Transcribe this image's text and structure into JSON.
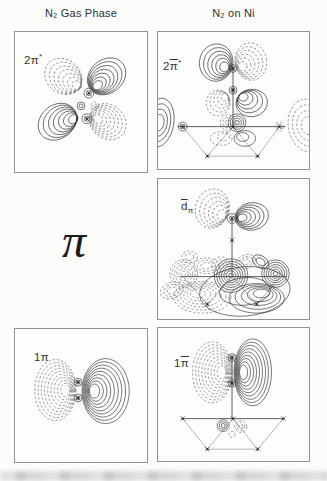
{
  "figure": {
    "header": {
      "left": "N₂ Gas Phase",
      "right": "N₂ on Ni"
    },
    "center_symbol": "π",
    "contour_convention": {
      "positive": "solid",
      "negative": "dashed"
    },
    "colors": {
      "solid": "#3d3d3d",
      "dashed": "#6f6f6f",
      "axis": "#4a4a4a",
      "lattice": "#a3a3a0",
      "atom": "#2b2b2b",
      "border": "#939390",
      "background": "#fdfdfc"
    }
  },
  "panels": [
    {
      "id": "2pi-star-gas",
      "label": {
        "pre": "2π",
        "bar": "",
        "sub": "",
        "sup": "*"
      },
      "plot": {
        "w": 134,
        "h": 142,
        "elements": [
          {
            "type": "lobe",
            "style": "solid",
            "cx": 93,
            "cy": 45,
            "rx": 21,
            "ry": 17,
            "rot": -40,
            "n": 7,
            "fx": 79,
            "fy": 59
          },
          {
            "type": "lobe",
            "style": "dashed",
            "cx": 49,
            "cy": 45,
            "rx": 20,
            "ry": 17,
            "rot": 40,
            "n": 7,
            "fx": 70,
            "fy": 59
          },
          {
            "type": "lobe",
            "style": "solid",
            "cx": 43,
            "cy": 91,
            "rx": 21,
            "ry": 17,
            "rot": -40,
            "n": 7,
            "fx": 68,
            "fy": 87
          },
          {
            "type": "lobe",
            "style": "dashed",
            "cx": 94,
            "cy": 91,
            "rx": 20,
            "ry": 17,
            "rot": 40,
            "n": 7,
            "fx": 79,
            "fy": 87
          },
          {
            "type": "rings",
            "style": "solid",
            "cx": 75,
            "cy": 62,
            "r": 5,
            "n": 2
          },
          {
            "type": "rings",
            "style": "solid",
            "cx": 73,
            "cy": 88,
            "r": 5,
            "n": 2
          },
          {
            "type": "rings",
            "style": "dashed",
            "cx": 81,
            "cy": 75,
            "r": 4,
            "n": 2
          },
          {
            "type": "rings",
            "style": "solid",
            "cx": 67,
            "cy": 75,
            "r": 4,
            "n": 2
          },
          {
            "type": "atom",
            "cx": 75,
            "cy": 62
          },
          {
            "type": "atom",
            "cx": 73,
            "cy": 88
          }
        ]
      }
    },
    {
      "id": "2pi-star-ni",
      "label": {
        "pre": "2",
        "bar": "π",
        "sub": "",
        "sup": "*"
      },
      "plot": {
        "w": 153,
        "h": 139,
        "elements": [
          {
            "type": "lobe",
            "style": "solid",
            "cx": 59,
            "cy": 31,
            "rx": 17,
            "ry": 19,
            "rot": 8,
            "n": 6,
            "fx": 72,
            "fy": 38
          },
          {
            "type": "lobe",
            "style": "dashed",
            "cx": 94,
            "cy": 30,
            "rx": 16,
            "ry": 19,
            "rot": -8,
            "n": 6,
            "fx": 81,
            "fy": 38
          },
          {
            "type": "lobe",
            "style": "dashed",
            "cx": 61,
            "cy": 72,
            "rx": 12,
            "ry": 13,
            "rot": 5,
            "n": 5,
            "fx": 72,
            "fy": 62
          },
          {
            "type": "lobe",
            "style": "solid",
            "cx": 95,
            "cy": 72,
            "rx": 16,
            "ry": 14,
            "rot": -8,
            "n": 5,
            "fx": 81,
            "fy": 62
          },
          {
            "type": "lobe",
            "style": "solid",
            "cx": 1,
            "cy": 92,
            "rx": 15,
            "ry": 25,
            "rot": 10,
            "n": 4
          },
          {
            "type": "lobe",
            "style": "dashed",
            "cx": 152,
            "cy": 95,
            "rx": 20,
            "ry": 27,
            "rot": -10,
            "n": 4
          },
          {
            "type": "line",
            "x1": 20,
            "y1": 96,
            "x2": 129,
            "y2": 96
          },
          {
            "type": "line",
            "x1": 76,
            "y1": 37,
            "x2": 76,
            "y2": 96
          },
          {
            "type": "line",
            "light": true,
            "x1": 25,
            "y1": 96,
            "x2": 50,
            "y2": 126
          },
          {
            "type": "line",
            "light": true,
            "x1": 50,
            "y1": 126,
            "x2": 76,
            "y2": 96
          },
          {
            "type": "line",
            "light": true,
            "x1": 76,
            "y1": 96,
            "x2": 101,
            "y2": 126
          },
          {
            "type": "line",
            "light": true,
            "x1": 101,
            "y1": 126,
            "x2": 123,
            "y2": 96
          },
          {
            "type": "line",
            "light": true,
            "x1": 50,
            "y1": 126,
            "x2": 101,
            "y2": 126
          },
          {
            "type": "rings",
            "style": "solid",
            "cx": 76,
            "cy": 37,
            "r": 4,
            "n": 2
          },
          {
            "type": "rings",
            "style": "solid",
            "cx": 76,
            "cy": 59,
            "r": 4,
            "n": 2
          },
          {
            "type": "rings",
            "style": "solid",
            "cx": 80,
            "cy": 92,
            "r": 9,
            "n": 4
          },
          {
            "type": "rings",
            "style": "dashed",
            "cx": 71,
            "cy": 92,
            "r": 8,
            "n": 3
          },
          {
            "type": "lobe",
            "style": "dashed",
            "cx": 64,
            "cy": 108,
            "rx": 11,
            "ry": 7,
            "rot": 0,
            "n": 2,
            "fx": 70,
            "fy": 104
          },
          {
            "type": "lobe",
            "style": "solid",
            "cx": 88,
            "cy": 108,
            "rx": 11,
            "ry": 8,
            "rot": 0,
            "n": 2,
            "fx": 82,
            "fy": 104
          },
          {
            "type": "rings",
            "style": "solid",
            "cx": 25,
            "cy": 96,
            "r": 4.5,
            "n": 2
          },
          {
            "type": "rings",
            "style": "dashed",
            "cx": 123,
            "cy": 96,
            "r": 4.5,
            "n": 2
          },
          {
            "type": "atom",
            "cx": 25,
            "cy": 96
          },
          {
            "type": "atom",
            "cx": 76,
            "cy": 96
          },
          {
            "type": "atom",
            "cx": 123,
            "cy": 96
          },
          {
            "type": "atom",
            "cx": 50,
            "cy": 126
          },
          {
            "type": "atom",
            "cx": 101,
            "cy": 126
          },
          {
            "type": "atom",
            "cx": 76,
            "cy": 37
          },
          {
            "type": "atom",
            "cx": 76,
            "cy": 59
          }
        ]
      }
    },
    {
      "id": "d-pi-ni",
      "label": {
        "pre": "",
        "bar": "d",
        "sub": "π",
        "sup": ""
      },
      "plot": {
        "w": 153,
        "h": 142,
        "elements": [
          {
            "type": "lobe",
            "style": "dashed",
            "cx": 55,
            "cy": 30,
            "rx": 17,
            "ry": 20,
            "rot": 15,
            "n": 6,
            "fx": 70,
            "fy": 40
          },
          {
            "type": "lobe",
            "style": "solid",
            "cx": 95,
            "cy": 38,
            "rx": 17,
            "ry": 14,
            "rot": -10,
            "n": 6,
            "fx": 80,
            "fy": 40
          },
          {
            "type": "rings",
            "style": "solid",
            "cx": 75,
            "cy": 40,
            "r": 5,
            "n": 2
          },
          {
            "type": "line",
            "x1": 75,
            "y1": 40,
            "x2": 75,
            "y2": 99
          },
          {
            "type": "line",
            "x1": 22,
            "y1": 99,
            "x2": 130,
            "y2": 99
          },
          {
            "type": "line",
            "light": true,
            "x1": 25,
            "y1": 99,
            "x2": 50,
            "y2": 127
          },
          {
            "type": "line",
            "light": true,
            "x1": 50,
            "y1": 127,
            "x2": 75,
            "y2": 99
          },
          {
            "type": "line",
            "light": true,
            "x1": 75,
            "y1": 99,
            "x2": 100,
            "y2": 127
          },
          {
            "type": "line",
            "light": true,
            "x1": 100,
            "y1": 127,
            "x2": 124,
            "y2": 99
          },
          {
            "type": "rings",
            "style": "dashed",
            "cx": 26,
            "cy": 96,
            "r": 14,
            "n": 6
          },
          {
            "type": "lobe",
            "style": "dashed",
            "cx": 14,
            "cy": 113,
            "rx": 12,
            "ry": 8,
            "rot": -20,
            "n": 3
          },
          {
            "type": "lobe",
            "style": "dashed",
            "cx": 32,
            "cy": 79,
            "rx": 8,
            "ry": 6,
            "rot": 0,
            "n": 2
          },
          {
            "type": "lobe",
            "style": "dashed",
            "cx": 49,
            "cy": 88,
            "rx": 13,
            "ry": 8,
            "rot": 0,
            "n": 3
          },
          {
            "type": "rings",
            "style": "solid",
            "cx": 74,
            "cy": 98,
            "r": 17,
            "n": 7
          },
          {
            "type": "rings",
            "style": "dashed",
            "cx": 64,
            "cy": 88,
            "r": 9,
            "n": 3
          },
          {
            "type": "lobe",
            "style": "dashed",
            "cx": 89,
            "cy": 84,
            "rx": 10,
            "ry": 7,
            "rot": -20,
            "n": 3
          },
          {
            "type": "rings",
            "style": "solid",
            "cx": 119,
            "cy": 96,
            "r": 14,
            "n": 6
          },
          {
            "type": "lobe",
            "style": "solid",
            "cx": 104,
            "cy": 84,
            "rx": 9,
            "ry": 6,
            "rot": 35,
            "n": 2
          },
          {
            "type": "lobe",
            "style": "dashed",
            "cx": 45,
            "cy": 120,
            "rx": 29,
            "ry": 16,
            "rot": 0,
            "n": 6,
            "fx": 38,
            "fy": 114
          },
          {
            "type": "lobe",
            "style": "solid",
            "cx": 100,
            "cy": 121,
            "rx": 28,
            "ry": 15,
            "rot": 0,
            "n": 5,
            "fx": 108,
            "fy": 113
          },
          {
            "type": "lobe",
            "style": "solid",
            "cx": 88,
            "cy": 114,
            "rx": 46,
            "ry": 25,
            "rot": -5,
            "n": 2
          },
          {
            "type": "atom",
            "cx": 75,
            "cy": 40
          },
          {
            "type": "atom",
            "cx": 75,
            "cy": 62
          },
          {
            "type": "atom",
            "cx": 50,
            "cy": 127
          },
          {
            "type": "atom",
            "cx": 100,
            "cy": 127
          }
        ]
      }
    },
    {
      "id": "1pi-gas",
      "label": {
        "pre": "1π",
        "bar": "",
        "sub": "",
        "sup": ""
      },
      "plot": {
        "w": 134,
        "h": 135,
        "elements": [
          {
            "type": "lobe",
            "style": "dashed",
            "cx": 41,
            "cy": 62,
            "rx": 21,
            "ry": 31,
            "rot": 0,
            "n": 9,
            "fx": 56,
            "fy": 62
          },
          {
            "type": "lobe",
            "style": "solid",
            "cx": 92,
            "cy": 63,
            "rx": 24,
            "ry": 33,
            "rot": 0,
            "n": 9,
            "fx": 75,
            "fy": 63
          },
          {
            "type": "rings",
            "style": "solid",
            "cx": 64,
            "cy": 54,
            "r": 4,
            "n": 2
          },
          {
            "type": "rings",
            "style": "solid",
            "cx": 64,
            "cy": 70,
            "r": 4,
            "n": 2
          },
          {
            "type": "atom",
            "cx": 64,
            "cy": 54
          },
          {
            "type": "atom",
            "cx": 64,
            "cy": 70
          }
        ]
      }
    },
    {
      "id": "1pi-ni",
      "label": {
        "pre": "1",
        "bar": "π",
        "sub": "",
        "sup": ""
      },
      "plot": {
        "w": 153,
        "h": 135,
        "elements": [
          {
            "type": "lobe",
            "style": "dashed",
            "cx": 55,
            "cy": 45,
            "rx": 20,
            "ry": 31,
            "rot": 0,
            "n": 9,
            "fx": 69,
            "fy": 45
          },
          {
            "type": "lobe",
            "style": "solid",
            "cx": 96,
            "cy": 45,
            "rx": 19,
            "ry": 34,
            "rot": 0,
            "n": 9,
            "fx": 82,
            "fy": 45
          },
          {
            "type": "line",
            "x1": 75,
            "y1": 30,
            "x2": 75,
            "y2": 92
          },
          {
            "type": "line",
            "x1": 24,
            "y1": 92,
            "x2": 128,
            "y2": 92
          },
          {
            "type": "line",
            "light": true,
            "x1": 25,
            "y1": 92,
            "x2": 50,
            "y2": 123
          },
          {
            "type": "line",
            "light": true,
            "x1": 50,
            "y1": 123,
            "x2": 76,
            "y2": 92
          },
          {
            "type": "line",
            "light": true,
            "x1": 76,
            "y1": 92,
            "x2": 101,
            "y2": 123
          },
          {
            "type": "line",
            "light": true,
            "x1": 101,
            "y1": 123,
            "x2": 127,
            "y2": 92
          },
          {
            "type": "line",
            "light": true,
            "x1": 50,
            "y1": 123,
            "x2": 101,
            "y2": 123
          },
          {
            "type": "rings",
            "style": "solid",
            "cx": 66,
            "cy": 99,
            "r": 6,
            "n": 3
          },
          {
            "type": "rings",
            "style": "dashed",
            "cx": 84,
            "cy": 100,
            "r": 6,
            "n": 3
          },
          {
            "type": "rings",
            "style": "dashed",
            "cx": 75,
            "cy": 108,
            "r": 3,
            "n": 1
          },
          {
            "type": "rings",
            "style": "solid",
            "cx": 75,
            "cy": 30,
            "r": 4,
            "n": 2
          },
          {
            "type": "rings",
            "style": "solid",
            "cx": 75,
            "cy": 56,
            "r": 4,
            "n": 2
          },
          {
            "type": "atom",
            "cx": 25,
            "cy": 92
          },
          {
            "type": "atom",
            "cx": 76,
            "cy": 92
          },
          {
            "type": "atom",
            "cx": 127,
            "cy": 92
          },
          {
            "type": "atom",
            "cx": 50,
            "cy": 123
          },
          {
            "type": "atom",
            "cx": 101,
            "cy": 123
          },
          {
            "type": "atom",
            "cx": 75,
            "cy": 30
          },
          {
            "type": "atom",
            "cx": 75,
            "cy": 56
          }
        ]
      }
    }
  ]
}
